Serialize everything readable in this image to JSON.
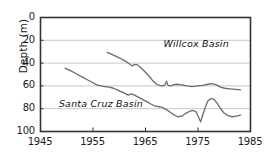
{
  "chart_data": {
    "type": "line",
    "title": "",
    "xlabel": "",
    "ylabel": "Depth (m)",
    "xlim": [
      1945,
      1985
    ],
    "ylim": [
      0,
      100
    ],
    "y_inverted": true,
    "grid": "horizontal",
    "legend_position": "inline-labels",
    "xticks": [
      "1945",
      "1955",
      "1965",
      "1975",
      "1985"
    ],
    "xtick_values": [
      1945,
      1955,
      1965,
      1975,
      1985
    ],
    "yticks": [
      "0",
      "20",
      "40",
      "60",
      "80",
      "100"
    ],
    "ytick_values": [
      0,
      20,
      40,
      60,
      80,
      100
    ],
    "line_color": "#6b6b6b",
    "axis_color": "#333333",
    "grid_color": "#c8c8c8",
    "series": [
      {
        "name": "Willcox Basin",
        "label_x": 1968.5,
        "label_y": 24,
        "points": [
          [
            1957.8,
            31.0
          ],
          [
            1959.0,
            33.5
          ],
          [
            1960.2,
            36.0
          ],
          [
            1961.2,
            38.5
          ],
          [
            1962.0,
            41.0
          ],
          [
            1962.6,
            43.0
          ],
          [
            1963.0,
            41.5
          ],
          [
            1963.6,
            42.0
          ],
          [
            1964.2,
            44.5
          ],
          [
            1965.0,
            48.0
          ],
          [
            1965.8,
            52.0
          ],
          [
            1966.5,
            56.0
          ],
          [
            1967.2,
            59.0
          ],
          [
            1967.8,
            60.0
          ],
          [
            1968.3,
            60.5
          ],
          [
            1968.8,
            59.5
          ],
          [
            1969.1,
            56.5
          ],
          [
            1969.4,
            60.0
          ],
          [
            1969.9,
            60.5
          ],
          [
            1970.4,
            59.5
          ],
          [
            1971.0,
            59.0
          ],
          [
            1972.0,
            59.5
          ],
          [
            1973.0,
            60.5
          ],
          [
            1974.0,
            61.0
          ],
          [
            1975.0,
            60.5
          ],
          [
            1976.0,
            60.0
          ],
          [
            1977.0,
            59.0
          ],
          [
            1977.8,
            58.5
          ],
          [
            1978.6,
            59.5
          ],
          [
            1979.4,
            61.5
          ],
          [
            1980.2,
            62.5
          ],
          [
            1981.2,
            63.0
          ],
          [
            1982.2,
            63.5
          ],
          [
            1983.2,
            64.0
          ]
        ]
      },
      {
        "name": "Santa Cruz Basin",
        "label_x": 1948.6,
        "label_y": 76,
        "points": [
          [
            1949.8,
            45.0
          ],
          [
            1951.0,
            47.5
          ],
          [
            1952.0,
            50.0
          ],
          [
            1953.0,
            52.5
          ],
          [
            1954.0,
            55.0
          ],
          [
            1955.0,
            57.5
          ],
          [
            1955.8,
            59.5
          ],
          [
            1956.6,
            60.5
          ],
          [
            1957.4,
            61.0
          ],
          [
            1958.2,
            61.5
          ],
          [
            1959.0,
            62.5
          ],
          [
            1960.0,
            64.5
          ],
          [
            1961.0,
            66.5
          ],
          [
            1961.8,
            68.5
          ],
          [
            1962.4,
            67.5
          ],
          [
            1963.0,
            68.5
          ],
          [
            1963.8,
            70.5
          ],
          [
            1964.6,
            72.5
          ],
          [
            1965.4,
            74.5
          ],
          [
            1966.2,
            76.5
          ],
          [
            1966.8,
            78.0
          ],
          [
            1967.4,
            78.5
          ],
          [
            1968.2,
            79.0
          ],
          [
            1969.0,
            81.0
          ],
          [
            1969.8,
            83.5
          ],
          [
            1970.6,
            86.0
          ],
          [
            1971.2,
            87.5
          ],
          [
            1972.0,
            87.0
          ],
          [
            1972.8,
            84.5
          ],
          [
            1973.6,
            82.5
          ],
          [
            1974.2,
            82.0
          ],
          [
            1974.8,
            83.5
          ],
          [
            1975.2,
            88.0
          ],
          [
            1975.6,
            92.0
          ],
          [
            1976.0,
            86.0
          ],
          [
            1976.5,
            79.0
          ],
          [
            1977.0,
            73.5
          ],
          [
            1977.6,
            71.5
          ],
          [
            1978.2,
            72.5
          ],
          [
            1978.8,
            76.0
          ],
          [
            1979.4,
            80.5
          ],
          [
            1980.0,
            84.0
          ],
          [
            1980.8,
            86.5
          ],
          [
            1981.6,
            87.5
          ],
          [
            1982.4,
            87.0
          ],
          [
            1983.2,
            86.0
          ]
        ]
      }
    ]
  },
  "plot_geometry": {
    "left": 40,
    "right": 250,
    "top": 17,
    "bottom": 131
  }
}
